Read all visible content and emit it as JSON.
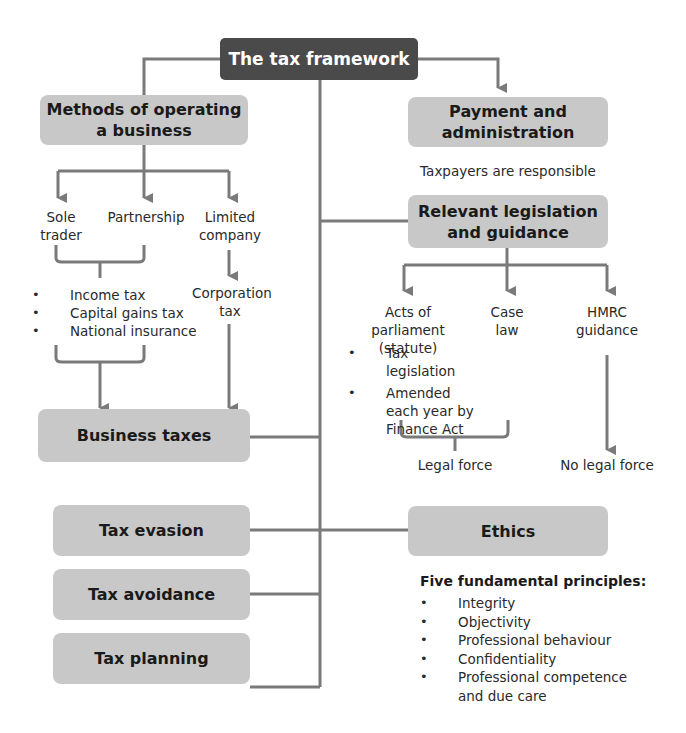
{
  "title": "The tax framework",
  "colors": {
    "title_box": "#4a4a4a",
    "node_box": "#c8c8c8",
    "connector": "#7a7a7a",
    "text": "#1a1a1a"
  },
  "nodes": {
    "methods": "Methods of operating a business",
    "payment": "Payment and administration",
    "legislation": "Relevant legislation and guidance",
    "business_taxes": "Business taxes",
    "tax_evasion": "Tax evasion",
    "tax_avoidance": "Tax avoidance",
    "tax_planning": "Tax planning",
    "ethics": "Ethics"
  },
  "methods_branch": {
    "sole_trader": "Sole trader",
    "partnership": "Partnership",
    "limited_company": "Limited company",
    "unincorporated_taxes": [
      "Income tax",
      "Capital gains tax",
      "National insurance"
    ],
    "company_tax": "Corporation tax"
  },
  "payment_note": "Taxpayers are responsible",
  "legislation_branch": {
    "acts": "Acts of parliament (statute)",
    "case_law": "Case law",
    "hmrc": "HMRC guidance",
    "acts_points": [
      "Tax legislation",
      "Amended each year by Finance Act"
    ],
    "legal_force": "Legal force",
    "no_legal_force": "No legal force"
  },
  "ethics_branch": {
    "heading": "Five fundamental principles:",
    "principles": [
      "Integrity",
      "Objectivity",
      "Professional behaviour",
      "Confidentiality",
      "Professional competence and due care"
    ]
  }
}
